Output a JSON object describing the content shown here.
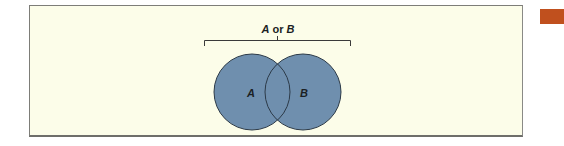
{
  "diagram": {
    "title": "A or B",
    "sets": [
      {
        "label": "A",
        "cx": 252,
        "cy": 92,
        "r": 38
      },
      {
        "label": "B",
        "cx": 303,
        "cy": 92,
        "r": 38
      }
    ],
    "relation": "union",
    "colors": {
      "background": "#fcfde9",
      "fill": "#6f8fae",
      "stroke": "#2c3a48",
      "frame": "#7d7d78",
      "accent": "#c0501e"
    }
  }
}
